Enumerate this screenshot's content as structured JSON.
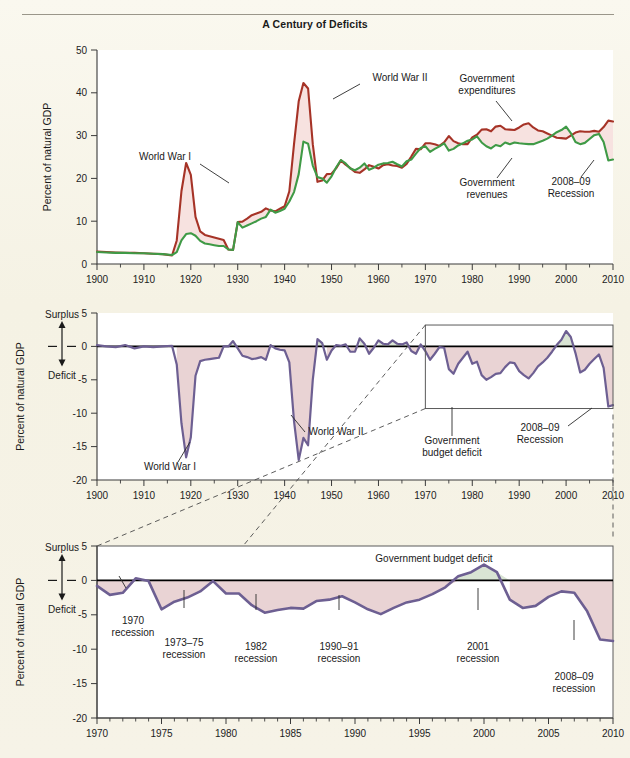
{
  "figure": {
    "title": "A Century of Deficits",
    "background_color": "#f7f4e9"
  },
  "colors": {
    "expenditures": "#a63327",
    "revenues": "#3f9a46",
    "deficit_line": "#6d5f92",
    "deficit_fill": "#e9d3d4",
    "surplus_fill": "#d9e4d4",
    "axis": "#3a3a3a"
  },
  "panel_top": {
    "ylabel": "Percent of natural GDP",
    "yticks": [
      "0",
      "10",
      "20",
      "30",
      "40",
      "50"
    ],
    "ytick_values": [
      0,
      10,
      20,
      30,
      40,
      50
    ],
    "xticks": [
      "1900",
      "1910",
      "1920",
      "1930",
      "1940",
      "1950",
      "1960",
      "1970",
      "1980",
      "1990",
      "2000",
      "2010"
    ],
    "xtick_values": [
      1900,
      1910,
      1920,
      1930,
      1940,
      1950,
      1960,
      1970,
      1980,
      1990,
      2000,
      2010
    ],
    "annotations": [
      {
        "name": "world-war-1",
        "text": "World War I"
      },
      {
        "name": "world-war-2",
        "text": "World War II"
      },
      {
        "name": "government-expenditures",
        "line1": "Government",
        "line2": "expenditures"
      },
      {
        "name": "government-revenues",
        "line1": "Government",
        "line2": "revenues"
      },
      {
        "name": "recession-2008-09",
        "line1": "2008–09",
        "line2": "Recession"
      }
    ]
  },
  "panel_middle": {
    "ylabel": "Percent of natural GDP",
    "surplus_label": "Surplus",
    "deficit_label": "Deficit",
    "yticks": [
      "-20",
      "-15",
      "-10",
      "-5",
      "0",
      "5"
    ],
    "ytick_values": [
      -20,
      -15,
      -10,
      -5,
      0,
      5
    ],
    "xticks": [
      "1900",
      "1910",
      "1920",
      "1930",
      "1940",
      "1950",
      "1960",
      "1970",
      "1980",
      "1990",
      "2000",
      "2010"
    ],
    "xtick_values": [
      1900,
      1910,
      1920,
      1930,
      1940,
      1950,
      1960,
      1970,
      1980,
      1990,
      2000,
      2010
    ],
    "annotations": [
      {
        "name": "world-war-1",
        "text": "World War I"
      },
      {
        "name": "world-war-2",
        "text": "World War II"
      },
      {
        "name": "government-budget-deficit",
        "line1": "Government",
        "line2": "budget deficit"
      },
      {
        "name": "recession-2008-09",
        "line1": "2008–09",
        "line2": "Recession"
      }
    ],
    "inset_box": {
      "x_start": 1970,
      "x_end": 2010,
      "y_top": 3.2,
      "y_bottom": -9.3
    }
  },
  "panel_bottom": {
    "ylabel": "Percent of natural GDP",
    "surplus_label": "Surplus",
    "deficit_label": "Deficit",
    "series_label": "Government budget deficit",
    "yticks": [
      "-20",
      "-15",
      "-10",
      "-5",
      "0",
      "5"
    ],
    "ytick_values": [
      -20,
      -15,
      -10,
      -5,
      0,
      5
    ],
    "xticks": [
      "1970",
      "1975",
      "1980",
      "1985",
      "1990",
      "1995",
      "2000",
      "2005",
      "2010"
    ],
    "xtick_values": [
      1970,
      1975,
      1980,
      1985,
      1990,
      1995,
      2000,
      2005,
      2010
    ],
    "annotations": [
      {
        "name": "recession-1970",
        "line1": "1970",
        "line2": "recession",
        "x": 1971.3,
        "y": -2.1
      },
      {
        "name": "recession-1973-75",
        "line1": "1973–75",
        "line2": "recession",
        "x": 1975.0,
        "y": -4.2
      },
      {
        "name": "recession-1982",
        "line1": "1982",
        "line2": "recession",
        "x": 1983.0,
        "y": -4.7
      },
      {
        "name": "recession-1990-91",
        "line1": "1990–91",
        "line2": "recession",
        "x": 1992.0,
        "y": -4.9
      },
      {
        "name": "recession-2001",
        "line1": "2001",
        "line2": "recession",
        "x": 2003.2,
        "y": -4.0
      },
      {
        "name": "recession-2008-09",
        "line1": "2008–09",
        "line2": "recession",
        "x": 2009.2,
        "y": -8.7
      }
    ]
  },
  "chart_data": [
    {
      "id": "panel_top",
      "type": "line",
      "title": "A Century of Deficits",
      "xlabel": "",
      "ylabel": "Percent of natural GDP",
      "xlim": [
        1900,
        2010
      ],
      "ylim": [
        0,
        50
      ],
      "grid": false,
      "legend": "annotated inline",
      "fill_between": "expenditures above revenues shaded pink",
      "x": [
        1900,
        1902,
        1904,
        1906,
        1908,
        1910,
        1912,
        1914,
        1916,
        1917,
        1918,
        1919,
        1920,
        1921,
        1922,
        1923,
        1924,
        1925,
        1926,
        1927,
        1928,
        1929,
        1930,
        1931,
        1932,
        1933,
        1934,
        1935,
        1936,
        1937,
        1938,
        1939,
        1940,
        1941,
        1942,
        1943,
        1944,
        1945,
        1946,
        1947,
        1948,
        1949,
        1950,
        1951,
        1952,
        1953,
        1954,
        1955,
        1956,
        1957,
        1958,
        1959,
        1960,
        1961,
        1962,
        1963,
        1964,
        1965,
        1966,
        1967,
        1968,
        1969,
        1970,
        1971,
        1972,
        1973,
        1974,
        1975,
        1976,
        1977,
        1978,
        1979,
        1980,
        1981,
        1982,
        1983,
        1984,
        1985,
        1986,
        1987,
        1988,
        1989,
        1990,
        1991,
        1992,
        1993,
        1994,
        1995,
        1996,
        1997,
        1998,
        1999,
        2000,
        2001,
        2002,
        2003,
        2004,
        2005,
        2006,
        2007,
        2008,
        2009,
        2010
      ],
      "series": [
        {
          "name": "Government expenditures",
          "color": "#a63327",
          "values": [
            2.9,
            2.8,
            2.7,
            2.6,
            2.6,
            2.5,
            2.4,
            2.3,
            2.0,
            5.5,
            17.0,
            23.6,
            20.8,
            11.0,
            7.6,
            6.8,
            6.5,
            6.2,
            5.9,
            5.6,
            3.4,
            3.3,
            9.8,
            9.9,
            10.6,
            11.4,
            11.8,
            12.2,
            13.0,
            12.5,
            12.3,
            12.9,
            13.5,
            17.0,
            28.0,
            38.0,
            42.3,
            41.0,
            28.0,
            19.2,
            19.5,
            21.0,
            21.1,
            22.4,
            24.2,
            23.2,
            22.4,
            21.5,
            21.3,
            22.1,
            23.1,
            22.7,
            22.3,
            23.1,
            23.3,
            23.0,
            22.9,
            22.5,
            23.4,
            25.1,
            26.9,
            26.8,
            28.2,
            28.2,
            28.0,
            27.6,
            28.4,
            29.9,
            28.7,
            28.2,
            28.0,
            28.0,
            29.6,
            30.2,
            31.4,
            31.5,
            31.0,
            32.1,
            32.3,
            31.5,
            31.4,
            31.3,
            31.9,
            32.6,
            32.9,
            31.9,
            31.2,
            31.0,
            30.5,
            30.0,
            29.5,
            29.4,
            29.3,
            30.0,
            30.7,
            31.0,
            30.9,
            30.9,
            31.1,
            30.9,
            32.0,
            33.5,
            33.3
          ]
        },
        {
          "name": "Government revenues",
          "color": "#3f9a46",
          "values": [
            2.8,
            2.7,
            2.6,
            2.6,
            2.5,
            2.5,
            2.4,
            2.3,
            2.1,
            2.8,
            5.5,
            7.0,
            7.2,
            6.6,
            5.4,
            4.8,
            4.6,
            4.4,
            4.2,
            4.2,
            3.4,
            3.3,
            9.8,
            8.5,
            9.0,
            9.5,
            10.0,
            10.6,
            11.0,
            12.7,
            12.0,
            12.4,
            12.9,
            14.6,
            16.8,
            21.0,
            28.6,
            28.1,
            23.0,
            20.3,
            20.0,
            19.0,
            20.5,
            22.6,
            24.3,
            23.5,
            22.3,
            21.9,
            22.5,
            23.5,
            22.0,
            22.5,
            23.2,
            23.5,
            23.6,
            23.9,
            23.3,
            22.8,
            24.0,
            24.4,
            25.8,
            27.1,
            27.5,
            26.2,
            26.9,
            27.5,
            28.2,
            26.5,
            26.9,
            27.7,
            28.2,
            28.8,
            29.1,
            29.8,
            28.4,
            27.5,
            27.0,
            27.8,
            27.5,
            28.4,
            28.0,
            28.4,
            28.2,
            28.1,
            28.0,
            28.0,
            28.4,
            28.8,
            29.3,
            30.0,
            30.8,
            31.3,
            32.1,
            30.6,
            28.5,
            28.0,
            28.3,
            29.2,
            30.1,
            30.4,
            28.5,
            24.2,
            24.4
          ]
        }
      ]
    },
    {
      "id": "panel_middle",
      "type": "area",
      "title": "",
      "xlabel": "",
      "ylabel": "Percent of natural GDP",
      "xlim": [
        1900,
        2010
      ],
      "ylim": [
        -20,
        5
      ],
      "grid": false,
      "series_name": "Government budget deficit",
      "x": [
        1900,
        1902,
        1904,
        1906,
        1908,
        1910,
        1912,
        1914,
        1916,
        1917,
        1918,
        1919,
        1920,
        1921,
        1922,
        1923,
        1924,
        1925,
        1926,
        1927,
        1928,
        1929,
        1930,
        1931,
        1932,
        1933,
        1934,
        1935,
        1936,
        1937,
        1938,
        1939,
        1940,
        1941,
        1942,
        1943,
        1944,
        1945,
        1946,
        1947,
        1948,
        1949,
        1950,
        1951,
        1952,
        1953,
        1954,
        1955,
        1956,
        1957,
        1958,
        1959,
        1960,
        1961,
        1962,
        1963,
        1964,
        1965,
        1966,
        1967,
        1968,
        1969,
        1970,
        1971,
        1972,
        1973,
        1974,
        1975,
        1976,
        1977,
        1978,
        1979,
        1980,
        1981,
        1982,
        1983,
        1984,
        1985,
        1986,
        1987,
        1988,
        1989,
        1990,
        1991,
        1992,
        1993,
        1994,
        1995,
        1996,
        1997,
        1998,
        1999,
        2000,
        2001,
        2002,
        2003,
        2004,
        2005,
        2006,
        2007,
        2008,
        2009,
        2010
      ],
      "values": [
        0.2,
        0.0,
        -0.1,
        0.2,
        -0.3,
        0.0,
        -0.1,
        0.0,
        0.1,
        -2.7,
        -11.5,
        -16.6,
        -13.6,
        -4.4,
        -2.2,
        -2.0,
        -1.9,
        -1.8,
        -1.7,
        0.0,
        0.0,
        0.8,
        -0.3,
        -1.4,
        -1.6,
        -1.9,
        -1.8,
        -1.6,
        -2.0,
        0.2,
        -0.3,
        -0.5,
        -0.6,
        -2.4,
        -11.2,
        -17.0,
        -13.7,
        -14.8,
        -5.0,
        1.1,
        0.5,
        -2.0,
        -0.6,
        0.2,
        0.1,
        0.3,
        -0.8,
        -0.8,
        1.2,
        0.4,
        -1.1,
        -0.2,
        0.9,
        0.4,
        0.3,
        0.9,
        0.4,
        0.3,
        0.6,
        -0.7,
        -1.1,
        0.3,
        -0.7,
        -2.0,
        -1.1,
        -0.1,
        -0.2,
        -3.4,
        -4.1,
        -2.6,
        -1.7,
        -0.8,
        -2.6,
        -2.3,
        -4.3,
        -5.0,
        -4.6,
        -4.1,
        -4.0,
        -3.1,
        -2.4,
        -2.5,
        -3.7,
        -4.3,
        -4.8,
        -4.0,
        -3.0,
        -2.4,
        -1.7,
        -0.8,
        0.2,
        1.0,
        2.3,
        1.4,
        -1.0,
        -3.9,
        -3.5,
        -2.6,
        -1.9,
        -1.2,
        -3.2,
        -9.0,
        -8.8
      ]
    },
    {
      "id": "panel_bottom",
      "type": "area",
      "title": "",
      "xlabel": "",
      "ylabel": "Percent of natural GDP",
      "xlim": [
        1970,
        2010
      ],
      "ylim": [
        -20,
        5
      ],
      "grid": false,
      "series_name": "Government budget deficit",
      "x": [
        1970,
        1971,
        1972,
        1973,
        1974,
        1975,
        1976,
        1977,
        1978,
        1979,
        1980,
        1981,
        1982,
        1983,
        1984,
        1985,
        1986,
        1987,
        1988,
        1989,
        1990,
        1991,
        1992,
        1993,
        1994,
        1995,
        1996,
        1997,
        1998,
        1999,
        2000,
        2001,
        2002,
        2003,
        2004,
        2005,
        2006,
        2007,
        2008,
        2009,
        2010
      ],
      "values": [
        -0.8,
        -2.1,
        -1.8,
        0.3,
        -0.1,
        -4.2,
        -3.1,
        -2.5,
        -1.6,
        -0.1,
        -1.9,
        -1.9,
        -3.6,
        -4.7,
        -4.3,
        -4.0,
        -4.1,
        -3.0,
        -2.8,
        -2.3,
        -3.2,
        -4.2,
        -4.9,
        -4.0,
        -3.2,
        -2.8,
        -2.0,
        -1.0,
        0.6,
        1.2,
        2.3,
        1.2,
        -2.8,
        -4.0,
        -3.7,
        -2.4,
        -1.6,
        -1.8,
        -4.5,
        -8.6,
        -8.8
      ]
    }
  ]
}
